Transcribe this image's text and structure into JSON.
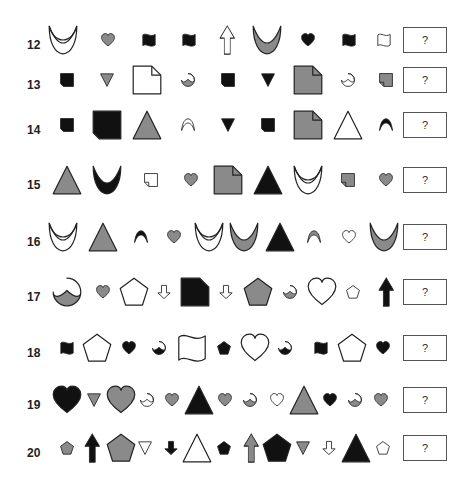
{
  "colors": {
    "black": "#111111",
    "gray": "#8a8a8a",
    "white": "#ffffff",
    "stroke": "#222222"
  },
  "answer_placeholder": "?",
  "rows": [
    {
      "number": "12",
      "y": 40,
      "items": [
        {
          "shape": "crescent-double",
          "fill": "white",
          "size": "large",
          "x": 55
        },
        {
          "shape": "heart",
          "fill": "gray",
          "size": "small",
          "x": 100
        },
        {
          "shape": "flag",
          "fill": "black",
          "size": "small",
          "x": 141
        },
        {
          "shape": "flag",
          "fill": "black",
          "size": "small",
          "x": 181
        },
        {
          "shape": "arrow-up",
          "fill": "white",
          "size": "large",
          "x": 219
        },
        {
          "shape": "crescent",
          "fill": "gray",
          "size": "large",
          "x": 259
        },
        {
          "shape": "heart",
          "fill": "black",
          "size": "small",
          "x": 300
        },
        {
          "shape": "flag",
          "fill": "black",
          "size": "small",
          "x": 341
        },
        {
          "shape": "flag",
          "fill": "white",
          "size": "small",
          "x": 376
        }
      ]
    },
    {
      "number": "13",
      "y": 80,
      "items": [
        {
          "shape": "square-cut",
          "fill": "black",
          "size": "small",
          "x": 59
        },
        {
          "shape": "triangle-down",
          "fill": "gray",
          "size": "small",
          "x": 99
        },
        {
          "shape": "page",
          "fill": "white",
          "size": "large",
          "x": 139
        },
        {
          "shape": "pacman",
          "fill": "gray",
          "size": "small",
          "x": 180
        },
        {
          "shape": "square-cut",
          "fill": "black",
          "size": "small",
          "x": 220
        },
        {
          "shape": "triangle-down",
          "fill": "black",
          "size": "small",
          "x": 260
        },
        {
          "shape": "page",
          "fill": "gray",
          "size": "large",
          "x": 300
        },
        {
          "shape": "pacman",
          "fill": "white",
          "size": "small",
          "x": 340
        },
        {
          "shape": "page-rev",
          "fill": "gray",
          "size": "small",
          "x": 378
        }
      ]
    },
    {
      "number": "14",
      "y": 125,
      "items": [
        {
          "shape": "square-cut",
          "fill": "black",
          "size": "small",
          "x": 59
        },
        {
          "shape": "square-cut",
          "fill": "black",
          "size": "large",
          "x": 99
        },
        {
          "shape": "triangle",
          "fill": "gray",
          "size": "large",
          "x": 139
        },
        {
          "shape": "crescent-thin",
          "fill": "white",
          "size": "small",
          "x": 180
        },
        {
          "shape": "triangle-down",
          "fill": "black",
          "size": "small",
          "x": 220
        },
        {
          "shape": "square-cut",
          "fill": "black",
          "size": "small",
          "x": 260
        },
        {
          "shape": "page",
          "fill": "gray",
          "size": "large",
          "x": 300
        },
        {
          "shape": "triangle",
          "fill": "white",
          "size": "large",
          "x": 340
        },
        {
          "shape": "crescent-thin",
          "fill": "black",
          "size": "small",
          "x": 378
        }
      ]
    },
    {
      "number": "15",
      "y": 180,
      "items": [
        {
          "shape": "triangle",
          "fill": "gray",
          "size": "large",
          "x": 59
        },
        {
          "shape": "crescent",
          "fill": "black",
          "size": "large",
          "x": 99
        },
        {
          "shape": "page-rev",
          "fill": "white",
          "size": "small",
          "x": 143
        },
        {
          "shape": "heart",
          "fill": "gray",
          "size": "small",
          "x": 183
        },
        {
          "shape": "page",
          "fill": "gray",
          "size": "large",
          "x": 220
        },
        {
          "shape": "triangle",
          "fill": "black",
          "size": "large",
          "x": 260
        },
        {
          "shape": "crescent-double",
          "fill": "white",
          "size": "large",
          "x": 300
        },
        {
          "shape": "page-rev",
          "fill": "gray",
          "size": "small",
          "x": 340
        },
        {
          "shape": "heart",
          "fill": "gray",
          "size": "small",
          "x": 378
        }
      ]
    },
    {
      "number": "16",
      "y": 237,
      "items": [
        {
          "shape": "crescent-double",
          "fill": "white",
          "size": "large",
          "x": 55
        },
        {
          "shape": "triangle",
          "fill": "gray",
          "size": "large",
          "x": 95
        },
        {
          "shape": "crescent-thin",
          "fill": "black",
          "size": "small",
          "x": 133
        },
        {
          "shape": "heart",
          "fill": "gray",
          "size": "small",
          "x": 166
        },
        {
          "shape": "crescent-double",
          "fill": "white",
          "size": "large",
          "x": 201
        },
        {
          "shape": "crescent",
          "fill": "gray",
          "size": "large",
          "x": 236
        },
        {
          "shape": "triangle",
          "fill": "black",
          "size": "large",
          "x": 272
        },
        {
          "shape": "crescent-thin",
          "fill": "gray",
          "size": "small",
          "x": 306
        },
        {
          "shape": "heart",
          "fill": "white",
          "size": "small",
          "x": 341
        },
        {
          "shape": "crescent",
          "fill": "gray",
          "size": "large",
          "x": 376
        }
      ]
    },
    {
      "number": "17",
      "y": 292,
      "items": [
        {
          "shape": "pacman",
          "fill": "gray",
          "size": "large",
          "x": 59
        },
        {
          "shape": "heart",
          "fill": "gray",
          "size": "small",
          "x": 95
        },
        {
          "shape": "pentagon",
          "fill": "white",
          "size": "large",
          "x": 126
        },
        {
          "shape": "arrow-down",
          "fill": "white",
          "size": "small",
          "x": 156
        },
        {
          "shape": "page-solid",
          "fill": "black",
          "size": "large",
          "x": 187
        },
        {
          "shape": "arrow-down",
          "fill": "white",
          "size": "small",
          "x": 218
        },
        {
          "shape": "pentagon",
          "fill": "gray",
          "size": "large",
          "x": 250
        },
        {
          "shape": "pacman",
          "fill": "gray",
          "size": "small",
          "x": 282
        },
        {
          "shape": "heart",
          "fill": "white",
          "size": "large",
          "x": 314
        },
        {
          "shape": "pentagon",
          "fill": "white",
          "size": "small",
          "x": 345
        },
        {
          "shape": "arrow-up",
          "fill": "black",
          "size": "large",
          "x": 378
        }
      ]
    },
    {
      "number": "18",
      "y": 348,
      "items": [
        {
          "shape": "flag",
          "fill": "black",
          "size": "small",
          "x": 59
        },
        {
          "shape": "pentagon",
          "fill": "white",
          "size": "large",
          "x": 89
        },
        {
          "shape": "heart",
          "fill": "black",
          "size": "small",
          "x": 121
        },
        {
          "shape": "pacman",
          "fill": "black",
          "size": "small",
          "x": 151
        },
        {
          "shape": "flag",
          "fill": "white",
          "size": "large",
          "x": 184
        },
        {
          "shape": "pentagon",
          "fill": "black",
          "size": "small",
          "x": 216
        },
        {
          "shape": "heart",
          "fill": "white",
          "size": "large",
          "x": 247
        },
        {
          "shape": "pacman",
          "fill": "black",
          "size": "small",
          "x": 277
        },
        {
          "shape": "flag",
          "fill": "black",
          "size": "small",
          "x": 313
        },
        {
          "shape": "pentagon",
          "fill": "white",
          "size": "large",
          "x": 344
        },
        {
          "shape": "heart",
          "fill": "black",
          "size": "small",
          "x": 375
        }
      ]
    },
    {
      "number": "19",
      "y": 400,
      "items": [
        {
          "shape": "heart",
          "fill": "black",
          "size": "large",
          "x": 59
        },
        {
          "shape": "triangle-down",
          "fill": "gray",
          "size": "small",
          "x": 86
        },
        {
          "shape": "heart",
          "fill": "gray",
          "size": "large",
          "x": 113
        },
        {
          "shape": "pacman",
          "fill": "white",
          "size": "small",
          "x": 139
        },
        {
          "shape": "heart",
          "fill": "gray",
          "size": "small",
          "x": 164
        },
        {
          "shape": "triangle",
          "fill": "black",
          "size": "large",
          "x": 191
        },
        {
          "shape": "heart",
          "fill": "gray",
          "size": "small",
          "x": 217
        },
        {
          "shape": "pacman",
          "fill": "gray",
          "size": "small",
          "x": 242
        },
        {
          "shape": "heart",
          "fill": "white",
          "size": "small",
          "x": 269
        },
        {
          "shape": "triangle",
          "fill": "gray",
          "size": "large",
          "x": 296
        },
        {
          "shape": "heart",
          "fill": "black",
          "size": "small",
          "x": 322
        },
        {
          "shape": "pacman",
          "fill": "gray",
          "size": "small",
          "x": 347
        },
        {
          "shape": "heart",
          "fill": "gray",
          "size": "small",
          "x": 373
        }
      ]
    },
    {
      "number": "20",
      "y": 448,
      "items": [
        {
          "shape": "pentagon",
          "fill": "gray",
          "size": "small",
          "x": 59
        },
        {
          "shape": "arrow-up",
          "fill": "black",
          "size": "large",
          "x": 84
        },
        {
          "shape": "pentagon",
          "fill": "gray",
          "size": "large",
          "x": 113
        },
        {
          "shape": "triangle-down",
          "fill": "white",
          "size": "small",
          "x": 137
        },
        {
          "shape": "arrow-down",
          "fill": "black",
          "size": "small",
          "x": 163
        },
        {
          "shape": "triangle",
          "fill": "white",
          "size": "large",
          "x": 189
        },
        {
          "shape": "pentagon",
          "fill": "black",
          "size": "small",
          "x": 216
        },
        {
          "shape": "arrow-up",
          "fill": "gray",
          "size": "large",
          "x": 243
        },
        {
          "shape": "pentagon",
          "fill": "black",
          "size": "large",
          "x": 269
        },
        {
          "shape": "triangle-down",
          "fill": "gray",
          "size": "small",
          "x": 295
        },
        {
          "shape": "arrow-down",
          "fill": "white",
          "size": "small",
          "x": 321
        },
        {
          "shape": "triangle",
          "fill": "black",
          "size": "large",
          "x": 348
        },
        {
          "shape": "pentagon",
          "fill": "white",
          "size": "small",
          "x": 375
        }
      ]
    }
  ]
}
